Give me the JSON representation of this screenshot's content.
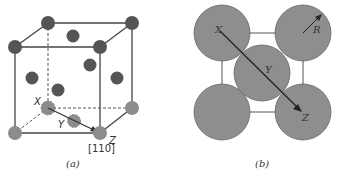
{
  "panel_a": {
    "caption": "(a)",
    "direction_label": "[110]",
    "point_labels": {
      "x": "X",
      "y": "Y",
      "z": "Z"
    },
    "colors": {
      "dark_atom": "#555555",
      "light_atom": "#8c8c8c",
      "edge": "#444444"
    },
    "corner_atoms_dark": [
      {
        "cx": 48,
        "cy": 23
      },
      {
        "cx": 132,
        "cy": 23
      },
      {
        "cx": 15,
        "cy": 47
      },
      {
        "cx": 100,
        "cy": 47
      }
    ],
    "face_atoms_dark": [
      {
        "cx": 73,
        "cy": 36
      },
      {
        "cx": 32,
        "cy": 78
      },
      {
        "cx": 90,
        "cy": 65
      },
      {
        "cx": 117,
        "cy": 78
      },
      {
        "cx": 58,
        "cy": 90
      }
    ],
    "bottom_atoms_light": [
      {
        "cx": 15,
        "cy": 133
      },
      {
        "cx": 100,
        "cy": 133
      },
      {
        "cx": 132,
        "cy": 108
      }
    ],
    "dashed_atoms": [
      {
        "name": "X",
        "cx": 48,
        "cy": 108
      },
      {
        "name": "Y",
        "cx": 74,
        "cy": 121
      }
    ]
  },
  "panel_b": {
    "caption": "(b)",
    "radius_label": "R",
    "point_labels": {
      "x": "X",
      "y": "Y",
      "z": "Z"
    },
    "colors": {
      "atom": "#8e8e8e",
      "outline": "#555555"
    },
    "atoms": [
      {
        "cx": 222,
        "cy": 33
      },
      {
        "cx": 303,
        "cy": 33
      },
      {
        "cx": 222,
        "cy": 112
      },
      {
        "cx": 303,
        "cy": 112
      },
      {
        "cx": 262,
        "cy": 73
      }
    ],
    "atom_radius": 28
  }
}
